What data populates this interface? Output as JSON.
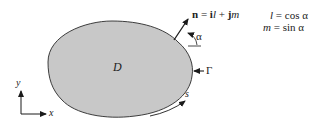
{
  "figure": {
    "region_label": "D",
    "boundary_label": "Γ",
    "arc_length_label": "s",
    "normal_vector": {
      "symbol": "n",
      "equals": " = ",
      "i": "i",
      "l": "l",
      "plus": " + ",
      "j": "j",
      "m": "m"
    },
    "angle_label": "α",
    "axes": {
      "x_label": "x",
      "y_label": "y"
    },
    "equations": [
      {
        "lhs": "l",
        "rhs": " = cos α"
      },
      {
        "lhs": "m",
        "rhs": " = sin α"
      }
    ],
    "colors": {
      "region_fill": "#c8c8c8",
      "stroke": "#2a2a2a",
      "background": "#ffffff"
    }
  }
}
